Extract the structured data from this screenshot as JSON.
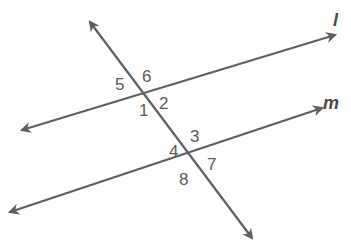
{
  "diagram": {
    "type": "parallel-lines-cut-by-transversal",
    "line_color": "#5f5f5f",
    "text_color": "#5a5a5a",
    "lines": [
      {
        "id": "l",
        "label": "l",
        "x1": 22,
        "y1": 130,
        "x2": 335,
        "y2": 35,
        "arrows": "both"
      },
      {
        "id": "m",
        "label": "m",
        "x1": 10,
        "y1": 212,
        "x2": 322,
        "y2": 108,
        "arrows": "both"
      },
      {
        "id": "t",
        "label": "",
        "x1": 90,
        "y1": 22,
        "x2": 252,
        "y2": 238,
        "arrows": "both"
      }
    ],
    "line_labels": {
      "l": "l",
      "m": "m"
    },
    "angles": {
      "a1": "1",
      "a2": "2",
      "a3": "3",
      "a4": "4",
      "a5": "5",
      "a6": "6",
      "a7": "7",
      "a8": "8"
    }
  }
}
